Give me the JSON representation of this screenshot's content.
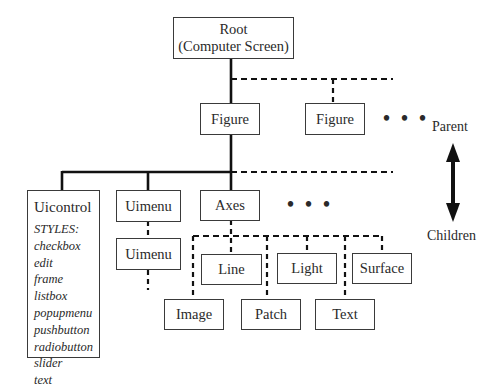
{
  "diagram": {
    "root": {
      "line1": "Root",
      "line2": "(Computer Screen)"
    },
    "figures": [
      "Figure",
      "Figure"
    ],
    "ellipsis": "• • •",
    "level2": {
      "uicontrol": {
        "title": "Uicontrol",
        "styles_label": "STYLES:",
        "styles": [
          "checkbox",
          "edit",
          "frame",
          "listbox",
          "popupmenu",
          "pushbutton",
          "radiobutton",
          "slider",
          "text"
        ]
      },
      "uimenu": "Uimenu",
      "uimenu_child": "Uimenu",
      "axes": "Axes"
    },
    "axes_children": {
      "row1": [
        "Line",
        "Light",
        "Surface"
      ],
      "row2": [
        "Image",
        "Patch",
        "Text"
      ]
    },
    "legend": {
      "top": "Parent",
      "bottom": "Children"
    },
    "colors": {
      "line": "#111111",
      "box_border": "#3a3a3a",
      "text": "#2a2a2a"
    }
  }
}
